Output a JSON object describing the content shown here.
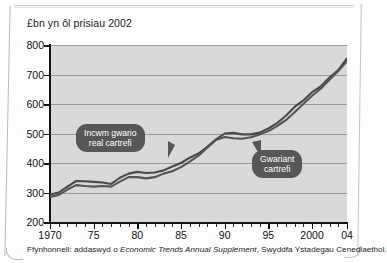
{
  "chart_title": "£bn yn ôl prisiau 2002",
  "source_note": {
    "prefix": "Ffynhonnell: addaswyd o ",
    "italic": "Economic Trends Annual Supplement",
    "suffix": ", Swyddfa Ystadegau Cenedlaethol."
  },
  "callouts": {
    "income": "Incwm gwario\nreal cartrefi",
    "expenditure": "Gwariant\ncartrefi"
  },
  "colors": {
    "plot_background": "#d9d9d9",
    "gridline": "#9a9a9a",
    "axis": "#151515",
    "series_line": "#4a4a4a",
    "callout_background": "#575757",
    "callout_text": "#ffffff"
  },
  "chart_data": {
    "type": "line",
    "title": "£bn yn ôl prisiau 2002",
    "xlabel": "",
    "ylabel": "£bn yn ôl prisiau 2002",
    "xlim": [
      1970,
      2004
    ],
    "ylim": [
      200,
      800
    ],
    "yticks": [
      200,
      300,
      400,
      500,
      600,
      700,
      800
    ],
    "ytick_labels": [
      "200",
      "300",
      "400",
      "500",
      "600",
      "700",
      "800"
    ],
    "xticks": [
      1970,
      1975,
      1980,
      1985,
      1990,
      1995,
      2000,
      2004
    ],
    "xtick_labels": [
      "1970",
      "75",
      "80",
      "85",
      "90",
      "95",
      "2000",
      "04"
    ],
    "minor_xticks_every": 1,
    "grid": "horizontal",
    "legend": "annotated-callouts",
    "x": [
      1970,
      1971,
      1972,
      1973,
      1974,
      1975,
      1976,
      1977,
      1978,
      1979,
      1980,
      1981,
      1982,
      1983,
      1984,
      1985,
      1986,
      1987,
      1988,
      1989,
      1990,
      1991,
      1992,
      1993,
      1994,
      1995,
      1996,
      1997,
      1998,
      1999,
      2000,
      2001,
      2002,
      2003,
      2004
    ],
    "series": [
      {
        "name": "Incwm gwario real cartrefi",
        "label": "Incwm gwario\nreal cartrefi",
        "values": [
          293,
          300,
          320,
          339,
          338,
          336,
          334,
          329,
          350,
          364,
          370,
          366,
          368,
          375,
          388,
          400,
          418,
          432,
          455,
          480,
          500,
          502,
          497,
          497,
          503,
          517,
          535,
          560,
          590,
          612,
          640,
          660,
          690,
          715,
          755
        ]
      },
      {
        "name": "Gwariant cartrefi",
        "label": "Gwariant\ncartrefi",
        "values": [
          285,
          292,
          310,
          325,
          322,
          320,
          322,
          320,
          337,
          352,
          352,
          348,
          352,
          364,
          372,
          386,
          405,
          425,
          452,
          478,
          488,
          484,
          482,
          487,
          497,
          508,
          525,
          545,
          572,
          600,
          628,
          652,
          682,
          712,
          745
        ]
      }
    ]
  }
}
